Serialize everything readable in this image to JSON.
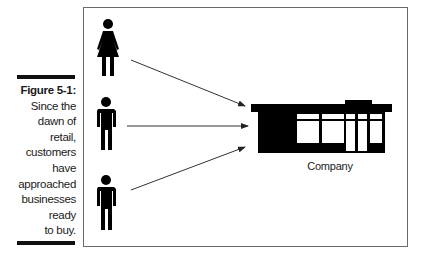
{
  "figure": {
    "label": "Figure 5-1:",
    "caption_lines": [
      "Since the",
      "dawn of",
      "retail,",
      "customers",
      "have",
      "approached",
      "businesses",
      "ready",
      "to buy."
    ]
  },
  "diagram": {
    "people": [
      {
        "type": "woman-icon"
      },
      {
        "type": "man-icon"
      },
      {
        "type": "man-icon"
      }
    ],
    "target_label": "Company",
    "target_icon": "storefront-icon",
    "colors": {
      "ink": "#000000",
      "frame": "#6a6a6a",
      "arrow": "#333333"
    }
  }
}
